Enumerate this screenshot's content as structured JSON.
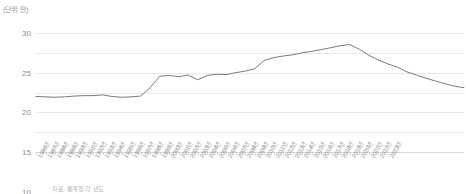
{
  "unit_label": "(단위: 만)",
  "caption": "자료: 통계청 각 년도",
  "colors": {
    "line": "#7a7a7a",
    "grid": "#e9e9e9",
    "axis": "#d9d9d9",
    "text": "#8c8c8c"
  },
  "chart_data": {
    "type": "line",
    "title": "",
    "xlabel": "",
    "ylabel": "",
    "unit": "만",
    "ylim": [
      0,
      30
    ],
    "yticks": [
      0,
      5,
      10,
      15,
      20,
      25,
      30
    ],
    "grid": true,
    "legend": "none",
    "categories": [
      "1986년",
      "1987년",
      "1988년",
      "1989년",
      "1990년",
      "1991년",
      "1992년",
      "1993년",
      "1994년",
      "1995년",
      "1996년",
      "1997년",
      "1998년",
      "1999년",
      "2000년",
      "2001년",
      "2002년",
      "2003년",
      "2004년",
      "2005년",
      "2006년",
      "2007년",
      "2008년",
      "2009년",
      "2010년",
      "2011년",
      "2012년",
      "2013년",
      "2014년",
      "2015년",
      "2016년",
      "2017년",
      "2018년",
      "2019년",
      "2020년",
      "2021년",
      "2022년",
      "2023년"
    ],
    "values": [
      14.0,
      13.9,
      13.8,
      13.9,
      14.1,
      14.2,
      14.2,
      14.4,
      14.0,
      13.8,
      13.9,
      14.1,
      16.2,
      19.1,
      19.3,
      19.0,
      19.4,
      18.2,
      19.3,
      19.6,
      19.5,
      20.0,
      20.4,
      21.0,
      23.1,
      23.8,
      24.2,
      24.5,
      25.0,
      25.4,
      25.8,
      26.3,
      26.8,
      27.1,
      25.9,
      24.4,
      23.2,
      22.2
    ],
    "values_tail": [
      21.4,
      20.2,
      19.4,
      18.6,
      17.9,
      17.2,
      16.6,
      16.2
    ],
    "peak": {
      "category": "2019년",
      "value": 27.1
    },
    "start": {
      "category": "1986년",
      "value": 14.0
    },
    "end": {
      "category": "2023년",
      "value": 16.2
    }
  }
}
